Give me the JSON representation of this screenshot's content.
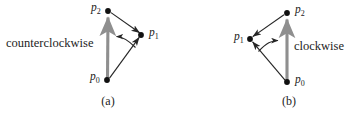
{
  "figure": {
    "colors": {
      "edge": "#262626",
      "axis_arrow": "#8a8a8a",
      "vertex_dot": "#111111",
      "text": "#1d1d1d",
      "background": "#ffffff"
    }
  },
  "panels": [
    {
      "id": "a",
      "caption": "(a)",
      "direction_label": "counterclockwise",
      "vertices": [
        {
          "name": "p2",
          "base": "p",
          "sub": "2",
          "x": 108,
          "y": 11
        },
        {
          "name": "p1",
          "base": "p",
          "sub": "1",
          "x": 141,
          "y": 35
        },
        {
          "name": "p0",
          "base": "p",
          "sub": "0",
          "x": 107,
          "y": 80
        }
      ],
      "edges": [
        {
          "from": "p0",
          "to": "p2",
          "style": "thick-gray-arrow"
        },
        {
          "from": "p0",
          "to": "p1",
          "style": "thin-black-arrow"
        },
        {
          "from": "p2",
          "to": "p1",
          "style": "thin-black-arrow"
        }
      ],
      "rotation_arc": {
        "from": "p1",
        "to": "p0p2-edge",
        "arrow_points": "left"
      }
    },
    {
      "id": "b",
      "caption": "(b)",
      "direction_label": "clockwise",
      "vertices": [
        {
          "name": "p2",
          "base": "p",
          "sub": "2",
          "x": 287,
          "y": 13
        },
        {
          "name": "p1",
          "base": "p",
          "sub": "1",
          "x": 250,
          "y": 39
        },
        {
          "name": "p0",
          "base": "p",
          "sub": "0",
          "x": 287,
          "y": 82
        }
      ],
      "edges": [
        {
          "from": "p0",
          "to": "p2",
          "style": "thick-gray-arrow"
        },
        {
          "from": "p0",
          "to": "p1",
          "style": "thin-black-arrow"
        },
        {
          "from": "p2",
          "to": "p1",
          "style": "thin-black-arrow"
        }
      ],
      "rotation_arc": {
        "from": "p1",
        "to": "p0p2-edge",
        "arrow_points": "right"
      }
    }
  ]
}
